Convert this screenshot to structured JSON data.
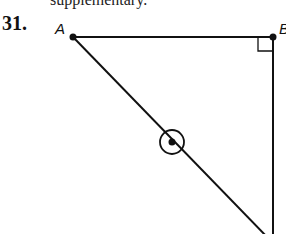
{
  "clipped_text": "supplementary.",
  "problem_number": "31.",
  "figure": {
    "labels": {
      "A": "A",
      "B": "B"
    },
    "points": {
      "A": [
        73,
        37
      ],
      "B": [
        273,
        37
      ],
      "C": [
        273,
        238
      ],
      "M": [
        172,
        142
      ]
    },
    "marks": [
      "right-angle-at-B",
      "circled-point-on-AC"
    ]
  }
}
